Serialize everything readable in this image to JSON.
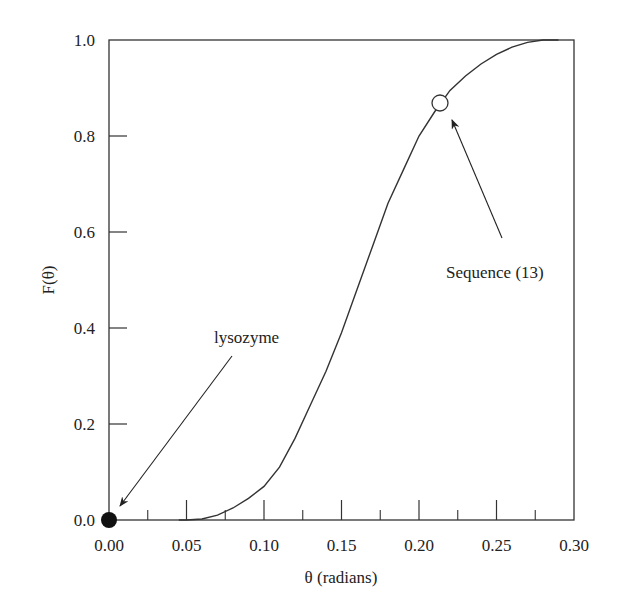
{
  "chart_data": {
    "type": "line",
    "title": "",
    "xlabel": "θ (radians)",
    "ylabel": "F(θ)",
    "xlim": [
      0.0,
      0.3
    ],
    "ylim": [
      0.0,
      1.0
    ],
    "grid": false,
    "legend": "none",
    "x_ticks": [
      "0.00",
      "0.05",
      "0.10",
      "0.15",
      "0.20",
      "0.25",
      "0.30"
    ],
    "x_minor_ticks": [
      0.025,
      0.075,
      0.125,
      0.175,
      0.225,
      0.275
    ],
    "y_ticks": [
      "0.0",
      "0.2",
      "0.4",
      "0.6",
      "0.8",
      "1.0"
    ],
    "series": [
      {
        "name": "F(θ)",
        "x": [
          0.045,
          0.05,
          0.06,
          0.07,
          0.08,
          0.09,
          0.1,
          0.11,
          0.12,
          0.13,
          0.14,
          0.15,
          0.16,
          0.17,
          0.18,
          0.19,
          0.2,
          0.21,
          0.22,
          0.23,
          0.24,
          0.25,
          0.26,
          0.27,
          0.28,
          0.29
        ],
        "y": [
          0.0,
          0.0,
          0.002,
          0.01,
          0.025,
          0.045,
          0.07,
          0.11,
          0.17,
          0.24,
          0.31,
          0.39,
          0.48,
          0.57,
          0.66,
          0.73,
          0.8,
          0.85,
          0.895,
          0.925,
          0.95,
          0.97,
          0.985,
          0.995,
          1.0,
          1.0
        ]
      }
    ],
    "markers": [
      {
        "name": "lysozyme",
        "x": 0.0,
        "y": 0.0,
        "style": "filled-circle"
      },
      {
        "name": "Sequence (13)",
        "x": 0.2135,
        "y": 0.869,
        "style": "open-circle"
      }
    ],
    "annotations": [
      {
        "text": "lysozyme",
        "arrow_to": [
          0.0,
          0.0
        ]
      },
      {
        "text": "Sequence (13)",
        "arrow_to": [
          0.2135,
          0.869
        ]
      }
    ]
  },
  "labels": {
    "xlabel": "θ (radians)",
    "ylabel": "F(θ)",
    "annot_lysozyme": "lysozyme",
    "annot_sequence": "Sequence (13)",
    "x_ticks": [
      "0.00",
      "0.05",
      "0.10",
      "0.15",
      "0.20",
      "0.25",
      "0.30"
    ],
    "y_ticks": [
      "0.0",
      "0.2",
      "0.4",
      "0.6",
      "0.8",
      "1.0"
    ]
  }
}
